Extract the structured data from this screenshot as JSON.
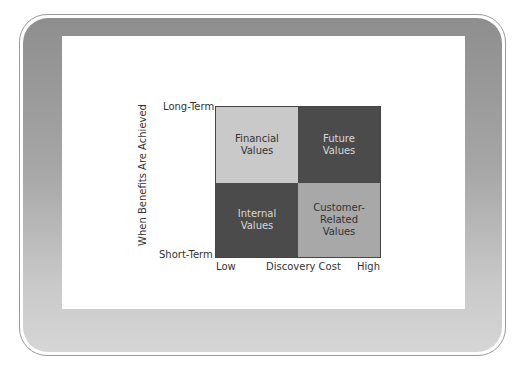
{
  "diagram": {
    "type": "2x2-matrix",
    "y_axis": {
      "label": "When Benefits Are Achieved",
      "top": "Long-Term",
      "bottom": "Short-Term"
    },
    "x_axis": {
      "label": "Discovery Cost",
      "left": "Low",
      "right": "High"
    },
    "quadrants": {
      "top_left": {
        "line1": "Financial",
        "line2": "Values",
        "line3": "",
        "color": "#c9c9c9"
      },
      "top_right": {
        "line1": "Future",
        "line2": "Values",
        "line3": "",
        "color": "#4b4b4b"
      },
      "bottom_left": {
        "line1": "Internal",
        "line2": "Values",
        "line3": "",
        "color": "#4b4b4b"
      },
      "bottom_right": {
        "line1": "Customer-",
        "line2": "Related",
        "line3": "Values",
        "color": "#a8a8a8"
      }
    }
  }
}
